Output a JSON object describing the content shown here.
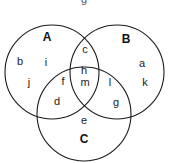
{
  "diagram": {
    "type": "venn-3",
    "top_cut_text": "g",
    "sets": [
      {
        "label": "A",
        "cx": 52,
        "cy": 72,
        "r": 47,
        "lx": 47,
        "ly": 38
      },
      {
        "label": "B",
        "cx": 117,
        "cy": 72,
        "r": 47,
        "lx": 126,
        "ly": 40
      },
      {
        "label": "C",
        "cx": 84,
        "cy": 114,
        "r": 47,
        "lx": 84,
        "ly": 140
      }
    ],
    "elements": [
      {
        "label": "b",
        "region": "A only",
        "x": 20,
        "y": 62
      },
      {
        "label": "i",
        "region": "A only",
        "x": 46,
        "y": 63
      },
      {
        "label": "j",
        "region": "A only",
        "x": 29,
        "y": 83
      },
      {
        "label": "c",
        "region": "A∩B",
        "x": 85,
        "y": 50
      },
      {
        "label": "h",
        "region": "A∩B∩C",
        "x": 84,
        "y": 71
      },
      {
        "label": "m",
        "region": "A∩B∩C",
        "x": 85,
        "y": 83
      },
      {
        "label": "f",
        "region": "A∩C",
        "x": 63,
        "y": 82
      },
      {
        "label": "d",
        "region": "A∩C",
        "x": 57,
        "y": 102
      },
      {
        "label": "a",
        "region": "B only",
        "x": 142,
        "y": 64
      },
      {
        "label": "k",
        "region": "B only",
        "x": 145,
        "y": 83
      },
      {
        "label": "l",
        "region": "B∩C",
        "x": 110,
        "y": 83
      },
      {
        "label": "g",
        "region": "B∩C",
        "x": 116,
        "y": 103
      },
      {
        "label": "e",
        "region": "C only",
        "x": 84,
        "y": 121
      }
    ]
  }
}
